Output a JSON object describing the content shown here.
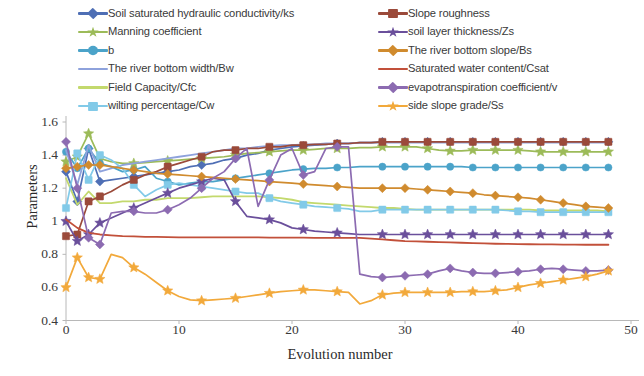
{
  "chart_data": {
    "type": "line",
    "title": "",
    "xlabel": "Evolution number",
    "ylabel": "Parameters",
    "xlim": [
      0,
      50
    ],
    "ylim": [
      0.4,
      1.6
    ],
    "xticks": [
      0,
      10,
      20,
      30,
      40,
      50
    ],
    "yticks": [
      "0.4",
      "0.6",
      "0.8",
      "1",
      "1.2",
      "1.4",
      "1.6"
    ],
    "grid": false,
    "legend_position": "top",
    "legend_columns": 2,
    "x": [
      0,
      1,
      2,
      3,
      4,
      5,
      6,
      7,
      8,
      9,
      10,
      11,
      12,
      13,
      14,
      15,
      16,
      17,
      18,
      19,
      20,
      21,
      22,
      23,
      24,
      25,
      26,
      27,
      28,
      29,
      30,
      31,
      32,
      33,
      34,
      35,
      36,
      37,
      38,
      39,
      40,
      41,
      42,
      43,
      44,
      45,
      46,
      47,
      48
    ],
    "series": [
      {
        "name": "Soil saturated hydraulic conductivity/ks",
        "color": "#4f6fb5",
        "marker": "diamond",
        "values": [
          1.3,
          1.12,
          1.44,
          1.24,
          1.25,
          1.26,
          1.27,
          1.28,
          1.29,
          1.3,
          1.31,
          1.33,
          1.34,
          1.35,
          1.37,
          1.38,
          1.4,
          1.41,
          1.43,
          1.44,
          1.45,
          1.455,
          1.46,
          1.465,
          1.47,
          1.47,
          1.475,
          1.475,
          1.48,
          1.48,
          1.48,
          1.48,
          1.48,
          1.48,
          1.48,
          1.48,
          1.48,
          1.48,
          1.48,
          1.48,
          1.48,
          1.48,
          1.48,
          1.48,
          1.48,
          1.48,
          1.48,
          1.48,
          1.48
        ]
      },
      {
        "name": "Manning coefficient",
        "color": "#9cbb59",
        "marker": "star",
        "values": [
          1.36,
          1.39,
          1.53,
          1.38,
          1.36,
          1.35,
          1.35,
          1.355,
          1.36,
          1.365,
          1.37,
          1.375,
          1.38,
          1.385,
          1.39,
          1.4,
          1.41,
          1.415,
          1.42,
          1.425,
          1.43,
          1.43,
          1.435,
          1.44,
          1.44,
          1.44,
          1.445,
          1.445,
          1.45,
          1.45,
          1.45,
          1.45,
          1.44,
          1.43,
          1.425,
          1.425,
          1.43,
          1.43,
          1.43,
          1.43,
          1.43,
          1.425,
          1.42,
          1.42,
          1.42,
          1.42,
          1.42,
          1.42,
          1.42
        ]
      },
      {
        "name": "b",
        "color": "#4ba3c9",
        "marker": "circle",
        "values": [
          1.42,
          1.32,
          1.44,
          1.35,
          1.33,
          1.3,
          1.31,
          1.33,
          1.26,
          1.24,
          1.22,
          1.23,
          1.24,
          1.24,
          1.25,
          1.26,
          1.27,
          1.28,
          1.29,
          1.3,
          1.31,
          1.315,
          1.32,
          1.32,
          1.325,
          1.325,
          1.33,
          1.33,
          1.33,
          1.33,
          1.33,
          1.33,
          1.33,
          1.33,
          1.33,
          1.33,
          1.325,
          1.325,
          1.325,
          1.325,
          1.325,
          1.325,
          1.325,
          1.325,
          1.325,
          1.325,
          1.325,
          1.325,
          1.325
        ]
      },
      {
        "name": "The river bottom width/Bw",
        "color": "#8ea2dc",
        "marker": "none",
        "values": [
          1.43,
          1.22,
          1.46,
          1.3,
          1.32,
          1.34,
          1.35,
          1.36,
          1.37,
          1.38,
          1.39,
          1.4,
          1.41,
          1.42,
          1.43,
          1.44,
          1.44,
          1.45,
          1.455,
          1.46,
          1.46,
          1.465,
          1.465,
          1.47,
          1.47,
          1.47,
          1.475,
          1.475,
          1.475,
          1.475,
          1.475,
          1.475,
          1.475,
          1.475,
          1.475,
          1.475,
          1.475,
          1.475,
          1.475,
          1.475,
          1.475,
          1.475,
          1.475,
          1.475,
          1.475,
          1.475,
          1.475,
          1.475,
          1.475
        ]
      },
      {
        "name": "Field Capacity/Cfc",
        "color": "#c3d96d",
        "marker": "none",
        "values": [
          1.26,
          1.1,
          1.18,
          1.11,
          1.11,
          1.12,
          1.12,
          1.13,
          1.13,
          1.14,
          1.14,
          1.14,
          1.145,
          1.15,
          1.15,
          1.15,
          1.15,
          1.15,
          1.145,
          1.14,
          1.13,
          1.115,
          1.11,
          1.105,
          1.1,
          1.095,
          1.09,
          1.085,
          1.08,
          1.08,
          1.075,
          1.07,
          1.07,
          1.07,
          1.07,
          1.07,
          1.07,
          1.07,
          1.07,
          1.07,
          1.07,
          1.07,
          1.065,
          1.065,
          1.065,
          1.065,
          1.065,
          1.065,
          1.06
        ]
      },
      {
        "name": "wilting percentage/Cw",
        "color": "#82cae8",
        "marker": "square",
        "values": [
          1.08,
          1.41,
          1.25,
          1.4,
          1.37,
          1.32,
          1.22,
          1.15,
          1.19,
          1.22,
          1.23,
          1.22,
          1.21,
          1.2,
          1.19,
          1.18,
          1.17,
          1.17,
          1.14,
          1.12,
          1.11,
          1.1,
          1.09,
          1.085,
          1.08,
          1.075,
          1.06,
          1.06,
          1.07,
          1.07,
          1.07,
          1.07,
          1.07,
          1.07,
          1.07,
          1.07,
          1.07,
          1.07,
          1.07,
          1.065,
          1.06,
          1.06,
          1.055,
          1.055,
          1.055,
          1.055,
          1.055,
          1.055,
          1.055
        ]
      },
      {
        "name": "Slope roughness",
        "color": "#9b4a3a",
        "marker": "square",
        "values": [
          0.91,
          0.92,
          1.12,
          1.15,
          1.18,
          1.22,
          1.25,
          1.28,
          1.3,
          1.33,
          1.35,
          1.37,
          1.39,
          1.42,
          1.43,
          1.43,
          1.44,
          1.44,
          1.45,
          1.45,
          1.46,
          1.46,
          1.465,
          1.465,
          1.47,
          1.47,
          1.475,
          1.475,
          1.48,
          1.48,
          1.48,
          1.48,
          1.48,
          1.48,
          1.48,
          1.48,
          1.48,
          1.48,
          1.48,
          1.48,
          1.48,
          1.48,
          1.48,
          1.48,
          1.48,
          1.48,
          1.48,
          1.48,
          1.48
        ]
      },
      {
        "name": "soil layer thickness/Zs",
        "color": "#6a4f9b",
        "marker": "star",
        "values": [
          1.0,
          0.88,
          0.92,
          0.99,
          1.02,
          1.05,
          1.08,
          1.11,
          1.14,
          1.17,
          1.2,
          1.22,
          1.24,
          1.26,
          1.25,
          1.12,
          1.03,
          1.02,
          1.01,
          0.99,
          0.96,
          0.95,
          0.94,
          0.935,
          0.93,
          0.925,
          0.92,
          0.92,
          0.92,
          0.92,
          0.92,
          0.92,
          0.92,
          0.92,
          0.92,
          0.92,
          0.92,
          0.92,
          0.92,
          0.92,
          0.92,
          0.92,
          0.92,
          0.92,
          0.92,
          0.92,
          0.92,
          0.92,
          0.92
        ]
      },
      {
        "name": "The river bottom slope/Bs",
        "color": "#d08b2e",
        "marker": "diamond",
        "values": [
          1.32,
          1.33,
          1.34,
          1.34,
          1.33,
          1.32,
          1.31,
          1.3,
          1.29,
          1.285,
          1.28,
          1.275,
          1.27,
          1.265,
          1.26,
          1.255,
          1.25,
          1.245,
          1.24,
          1.235,
          1.23,
          1.225,
          1.22,
          1.215,
          1.21,
          1.205,
          1.2,
          1.2,
          1.2,
          1.2,
          1.2,
          1.195,
          1.19,
          1.185,
          1.18,
          1.175,
          1.17,
          1.16,
          1.155,
          1.15,
          1.145,
          1.14,
          1.13,
          1.12,
          1.11,
          1.1,
          1.09,
          1.085,
          1.08
        ]
      },
      {
        "name": "Saturated water content/Csat",
        "color": "#c2503a",
        "marker": "none",
        "values": [
          1.01,
          0.96,
          0.93,
          0.92,
          0.915,
          0.91,
          0.908,
          0.906,
          0.905,
          0.904,
          0.903,
          0.903,
          0.903,
          0.902,
          0.902,
          0.902,
          0.902,
          0.902,
          0.901,
          0.901,
          0.901,
          0.901,
          0.9,
          0.9,
          0.9,
          0.9,
          0.9,
          0.895,
          0.89,
          0.885,
          0.88,
          0.878,
          0.876,
          0.874,
          0.872,
          0.87,
          0.868,
          0.866,
          0.864,
          0.863,
          0.862,
          0.861,
          0.86,
          0.86,
          0.859,
          0.859,
          0.858,
          0.858,
          0.858
        ]
      },
      {
        "name": "evapotranspiration coefficient/v",
        "color": "#8c6bb1",
        "marker": "diamond",
        "values": [
          1.48,
          1.2,
          0.9,
          0.86,
          1.05,
          1.06,
          1.06,
          1.05,
          1.05,
          1.07,
          1.1,
          1.14,
          1.2,
          1.26,
          1.3,
          1.38,
          1.44,
          1.09,
          1.25,
          1.4,
          1.44,
          1.28,
          1.3,
          1.44,
          1.45,
          1.45,
          0.68,
          0.665,
          0.66,
          0.665,
          0.67,
          0.675,
          0.68,
          0.7,
          0.715,
          0.7,
          0.69,
          0.685,
          0.685,
          0.69,
          0.695,
          0.7,
          0.71,
          0.715,
          0.71,
          0.705,
          0.7,
          0.7,
          0.705
        ]
      },
      {
        "name": "side slope grade/Ss",
        "color": "#f2a93b",
        "marker": "star",
        "values": [
          0.6,
          0.78,
          0.66,
          0.65,
          0.8,
          0.78,
          0.72,
          0.68,
          0.63,
          0.58,
          0.545,
          0.525,
          0.52,
          0.525,
          0.53,
          0.535,
          0.545,
          0.555,
          0.565,
          0.575,
          0.58,
          0.585,
          0.585,
          0.58,
          0.575,
          0.57,
          0.5,
          0.52,
          0.555,
          0.565,
          0.57,
          0.57,
          0.57,
          0.57,
          0.57,
          0.575,
          0.575,
          0.575,
          0.58,
          0.585,
          0.6,
          0.615,
          0.625,
          0.635,
          0.645,
          0.655,
          0.665,
          0.68,
          0.7
        ]
      }
    ]
  }
}
